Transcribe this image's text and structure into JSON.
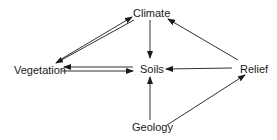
{
  "diagram": {
    "nodes": [
      {
        "id": "climate",
        "label": "Climate"
      },
      {
        "id": "vegetation",
        "label": "Vegetation"
      },
      {
        "id": "soils",
        "label": "Soils"
      },
      {
        "id": "relief",
        "label": "Relief"
      },
      {
        "id": "geology",
        "label": "Geology"
      }
    ],
    "edges": [
      {
        "from": "vegetation",
        "to": "climate"
      },
      {
        "from": "climate",
        "to": "vegetation"
      },
      {
        "from": "climate",
        "to": "soils"
      },
      {
        "from": "vegetation",
        "to": "soils"
      },
      {
        "from": "soils",
        "to": "vegetation"
      },
      {
        "from": "relief",
        "to": "soils"
      },
      {
        "from": "relief",
        "to": "climate"
      },
      {
        "from": "geology",
        "to": "soils"
      },
      {
        "from": "geology",
        "to": "relief"
      }
    ],
    "line_color": "#1a1a1a"
  }
}
